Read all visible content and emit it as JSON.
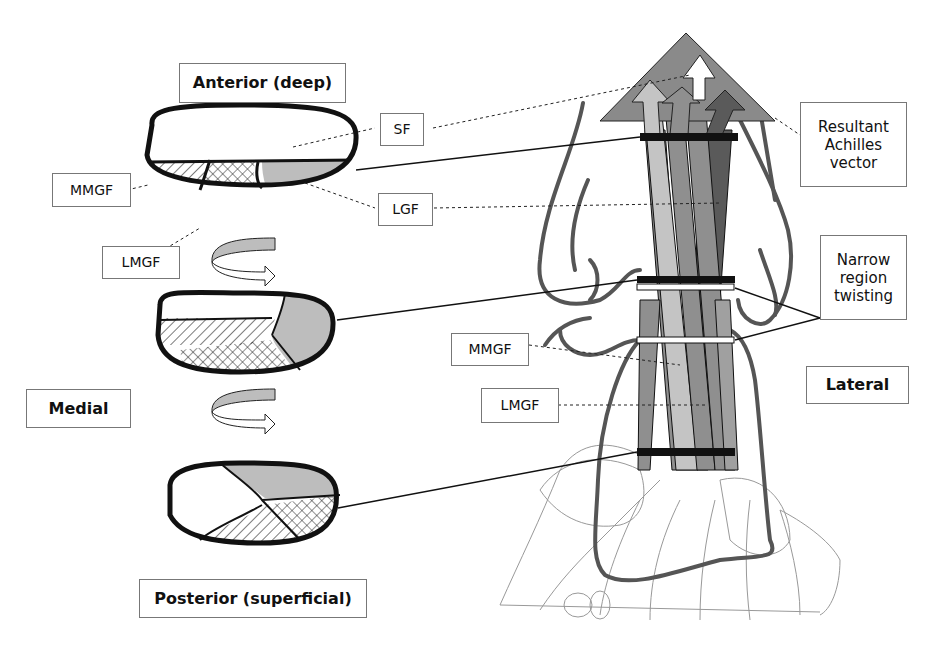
{
  "labels": {
    "anterior": "Anterior (deep)",
    "posterior": "Posterior (superficial)",
    "medial": "Medial",
    "lateral": "Lateral",
    "sf": "SF",
    "lgf": "LGF",
    "mmgf_left": "MMGF",
    "lmgf_left": "LMGF",
    "mmgf_right": "MMGF",
    "lmgf_right": "LMGF",
    "resultant": "Resultant Achilles vector",
    "narrow": "Narrow region twisting"
  },
  "colors": {
    "outline": "#111111",
    "light_gray": "#c4c4c4",
    "mid_gray": "#8f8f8f",
    "dark_gray": "#5a5a5a",
    "bone_line": "#555555"
  }
}
